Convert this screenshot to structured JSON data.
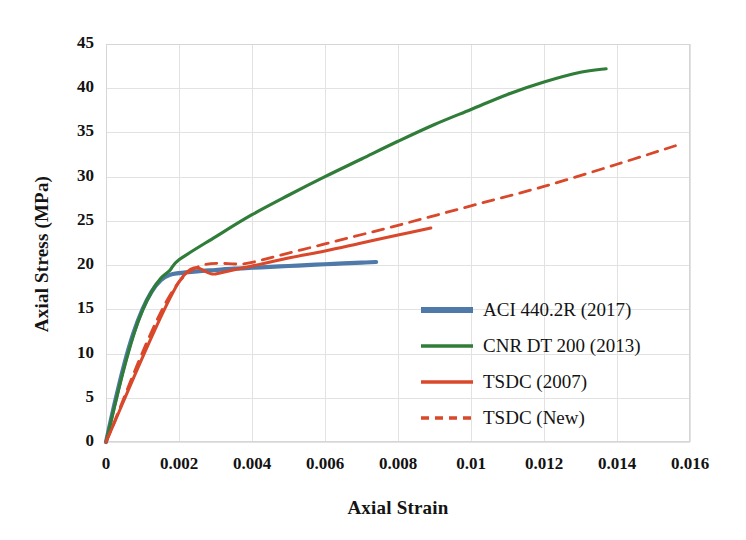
{
  "chart_data": {
    "type": "line",
    "title": "",
    "xlabel": "Axial Strain",
    "ylabel": "Axial Stress (MPa)",
    "xlim": [
      0,
      0.016
    ],
    "ylim": [
      0,
      45
    ],
    "xticks": [
      "0",
      "0.002",
      "0.004",
      "0.006",
      "0.008",
      "0.01",
      "0.012",
      "0.014",
      "0.016"
    ],
    "xtick_values": [
      0,
      0.002,
      0.004,
      0.006,
      0.008,
      0.01,
      0.012,
      0.014,
      0.016
    ],
    "yticks": [
      "0",
      "5",
      "10",
      "15",
      "20",
      "25",
      "30",
      "35",
      "40",
      "45"
    ],
    "ytick_values": [
      0,
      5,
      10,
      15,
      20,
      25,
      30,
      35,
      40,
      45
    ],
    "grid": true,
    "legend_position": "center-right",
    "series": [
      {
        "name": "ACI 440.2R (2017)",
        "color": "#4f79a8",
        "style": "solid",
        "width": 4.2,
        "x": [
          0,
          0.00025,
          0.0005,
          0.00075,
          0.001,
          0.00125,
          0.0015,
          0.00175,
          0.002,
          0.0025,
          0.003,
          0.0035,
          0.004,
          0.0045,
          0.005,
          0.0055,
          0.006,
          0.0065,
          0.007,
          0.0074
        ],
        "y": [
          0,
          4.6,
          8.8,
          12.3,
          15.0,
          17.0,
          18.3,
          18.9,
          19.1,
          19.3,
          19.45,
          19.6,
          19.7,
          19.8,
          19.9,
          20.0,
          20.1,
          20.2,
          20.28,
          20.35
        ]
      },
      {
        "name": "CNR DT 200 (2013)",
        "color": "#2f7d39",
        "style": "solid",
        "width": 3.2,
        "x": [
          0,
          0.00025,
          0.0005,
          0.00075,
          0.001,
          0.00125,
          0.0015,
          0.00175,
          0.002,
          0.003,
          0.004,
          0.005,
          0.006,
          0.007,
          0.008,
          0.009,
          0.01,
          0.011,
          0.012,
          0.013,
          0.0137
        ],
        "y": [
          0,
          4.3,
          8.4,
          12.0,
          14.9,
          17.0,
          18.5,
          19.4,
          20.6,
          23.2,
          25.7,
          27.9,
          30.0,
          32.0,
          34.0,
          35.9,
          37.6,
          39.3,
          40.7,
          41.8,
          42.2
        ]
      },
      {
        "name": "TSDC (2007)",
        "color": "#d9482a",
        "style": "solid",
        "width": 3.0,
        "x": [
          0,
          0.002,
          0.003,
          0.004,
          0.005,
          0.006,
          0.007,
          0.008,
          0.0089
        ],
        "y": [
          0,
          18.1,
          19.0,
          19.9,
          20.8,
          21.6,
          22.5,
          23.4,
          24.2
        ]
      },
      {
        "name": "TSDC (New)",
        "color": "#d9482a",
        "style": "dashed",
        "width": 2.8,
        "x": [
          0,
          0.002,
          0.004,
          0.006,
          0.008,
          0.01,
          0.012,
          0.014,
          0.0156
        ],
        "y": [
          0,
          18.1,
          20.3,
          22.4,
          24.5,
          26.7,
          28.9,
          31.4,
          33.5
        ]
      }
    ]
  },
  "legend": {
    "items": [
      {
        "label": "ACI 440.2R (2017)",
        "color": "#4f79a8",
        "style": "solid",
        "thickness": 6
      },
      {
        "label": "CNR DT 200 (2013)",
        "color": "#2f7d39",
        "style": "solid",
        "thickness": 3.5
      },
      {
        "label": "TSDC (2007)",
        "color": "#d9482a",
        "style": "solid",
        "thickness": 3.5
      },
      {
        "label": "TSDC (New)",
        "color": "#d9482a",
        "style": "dashed",
        "thickness": 3.5
      }
    ]
  },
  "colors": {
    "aci_blue": "#4f79a8",
    "cnr_green": "#2f7d39",
    "tsdc_red": "#d9482a",
    "grid": "#e2e2e2",
    "border": "#d6d6d6",
    "background": "#ffffff",
    "text": "#131313"
  }
}
